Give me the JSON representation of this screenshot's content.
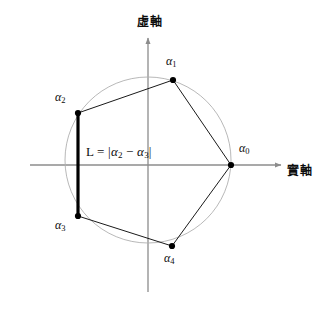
{
  "figure": {
    "title_semantic": "roots-of-unity-complex-plane-diagram",
    "background_color": "#ffffff",
    "width": 317,
    "height": 312
  },
  "axes": {
    "imaginary": {
      "label": "虛軸",
      "orientation": "vertical",
      "arrow": "up",
      "x": 148,
      "y_top": 38,
      "y_bottom": 292,
      "color": "#8c8c8c",
      "label_x": 148,
      "label_y": 22
    },
    "real": {
      "label": "實軸",
      "orientation": "horizontal",
      "arrow": "right",
      "y": 165,
      "x_left": 30,
      "x_right": 281,
      "color": "#8c8c8c",
      "label_x": 293,
      "label_y": 172
    }
  },
  "circle": {
    "name": "unit-circle",
    "cx": 148,
    "cy": 160,
    "r": 83,
    "stroke": "#b0b0b0",
    "stroke_width": 0.9,
    "fill": "none"
  },
  "vertices": [
    {
      "id": "alpha0",
      "base": "α",
      "sub": "0",
      "x": 231,
      "y": 165,
      "label_x": 243,
      "label_y": 148
    },
    {
      "id": "alpha1",
      "base": "α",
      "sub": "1",
      "x": 173,
      "y": 80,
      "label_x": 168,
      "label_y": 60
    },
    {
      "id": "alpha2",
      "base": "α",
      "sub": "2",
      "x": 78,
      "y": 113,
      "label_x": 56,
      "label_y": 96
    },
    {
      "id": "alpha3",
      "base": "α",
      "sub": "3",
      "x": 78,
      "y": 216,
      "label_x": 56,
      "label_y": 222
    },
    {
      "id": "alpha4",
      "base": "α",
      "sub": "4",
      "x": 172,
      "y": 246,
      "label_x": 166,
      "label_y": 256
    }
  ],
  "edges": [
    {
      "name": "edge-alpha0-alpha1",
      "from": "alpha0",
      "to": "alpha1",
      "x1": 231,
      "y1": 165,
      "x2": 173,
      "y2": 80,
      "stroke": "#1a1a1a",
      "stroke_width": 1
    },
    {
      "name": "edge-alpha1-alpha2",
      "from": "alpha1",
      "to": "alpha2",
      "x1": 173,
      "y1": 80,
      "x2": 78,
      "y2": 113,
      "stroke": "#1a1a1a",
      "stroke_width": 1
    },
    {
      "name": "edge-alpha3-alpha4",
      "from": "alpha3",
      "to": "alpha4",
      "x1": 78,
      "y1": 216,
      "x2": 172,
      "y2": 246,
      "stroke": "#1a1a1a",
      "stroke_width": 1
    },
    {
      "name": "edge-alpha4-alpha0",
      "from": "alpha4",
      "to": "alpha0",
      "x1": 172,
      "y1": 246,
      "x2": 231,
      "y2": 165,
      "stroke": "#1a1a1a",
      "stroke_width": 1
    }
  ],
  "highlight_segment": {
    "name": "segment-L-alpha2-alpha3",
    "from": "alpha2",
    "to": "alpha3",
    "x1": 78,
    "y1": 113,
    "x2": 78,
    "y2": 216,
    "stroke": "#000000",
    "stroke_width": 3.2
  },
  "formula": {
    "text": "L = |α₂ − α₃|",
    "lead": "L",
    "equals": " = ",
    "open_bar": "|",
    "term1_base": "α",
    "term1_sub": "2",
    "minus": " − ",
    "term2_base": "α",
    "term2_sub": "3",
    "close_bar": "|",
    "x": 85,
    "y": 151
  },
  "marker": {
    "shape": "filled-circle",
    "radius": 3.1,
    "fill": "#000000"
  }
}
